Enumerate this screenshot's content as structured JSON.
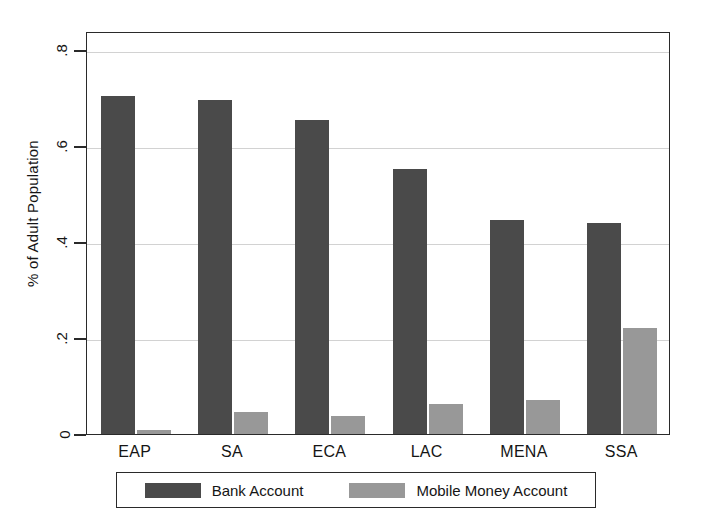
{
  "chart_data": {
    "type": "bar",
    "title": "",
    "subtitle": "",
    "xlabel": "",
    "ylabel": "% of Adult Population",
    "categories": [
      "EAP",
      "SA",
      "ECA",
      "LAC",
      "MENA",
      "SSA"
    ],
    "series": [
      {
        "name": "Bank Account",
        "color": "#4a4a4a",
        "values": [
          0.705,
          0.697,
          0.655,
          0.553,
          0.446,
          0.44
        ]
      },
      {
        "name": "Mobile Money Account",
        "color": "#989898",
        "values": [
          0.008,
          0.046,
          0.038,
          0.062,
          0.07,
          0.222
        ]
      }
    ],
    "ylim": [
      0,
      0.84
    ],
    "ytick_values": [
      0,
      0.2,
      0.4,
      0.6,
      0.8
    ],
    "ytick_labels": [
      "0",
      ".2",
      ".4",
      ".6",
      ".8"
    ],
    "grid": true,
    "grid_axis": "y",
    "legend_position": "bottom",
    "legend_entries": [
      "Bank Account",
      "Mobile Money Account"
    ]
  },
  "axis": {
    "y_title": "% of Adult Population"
  },
  "legend": {
    "items": [
      {
        "label": "Bank Account"
      },
      {
        "label": "Mobile Money Account"
      }
    ]
  }
}
